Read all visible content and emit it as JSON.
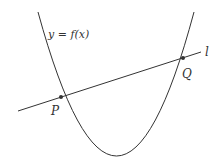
{
  "diagram": {
    "curve_label": "y = f(x)",
    "line_label": "l",
    "point_p_label": "P",
    "point_q_label": "Q",
    "stroke_color": "#333333",
    "background": "#ffffff"
  }
}
